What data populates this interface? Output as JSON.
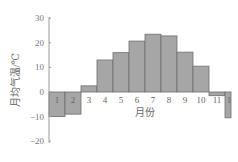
{
  "chart_data": {
    "type": "bar",
    "title": "",
    "xlabel": "月份",
    "ylabel": "月均气温/℃",
    "categories": [
      "1",
      "2",
      "3",
      "4",
      "5",
      "6",
      "7",
      "8",
      "9",
      "10",
      "11",
      "1"
    ],
    "values": [
      -10,
      -9,
      2.5,
      13,
      16,
      20.7,
      23.5,
      22.8,
      16.2,
      10.5,
      -1.5,
      -10.5
    ],
    "ylim": [
      -20,
      30
    ],
    "yticks": [
      30,
      20,
      10,
      0,
      -10,
      -20
    ],
    "grid": false,
    "colors": {
      "bar_fill": "#a6a6a6",
      "bar_stroke": "#6e6e6e",
      "axis": "#9a9a9a"
    }
  }
}
